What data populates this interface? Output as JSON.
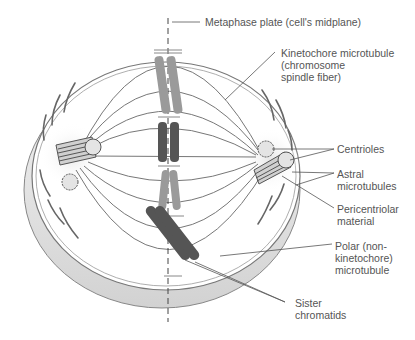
{
  "labels": {
    "metaphase_plate": "Metaphase plate (cell's midplane)",
    "kinetochore_mt": [
      "Kinetochore microtubule",
      "(chromosome",
      "spindle fiber)"
    ],
    "centrioles": "Centrioles",
    "astral_mt": [
      "Astral",
      "microtubules"
    ],
    "pericentriolar": [
      "Pericentriolar",
      "material"
    ],
    "polar_mt": [
      "Polar (non-",
      "kinetochore)",
      "microtubule"
    ],
    "sister_chromatids": [
      "Sister",
      "chromatids"
    ]
  },
  "colors": {
    "line": "#777777",
    "chromosome_light": "#9a9a9a",
    "chromosome_dark": "#555555",
    "cell_rim": "#d8d8d8"
  }
}
